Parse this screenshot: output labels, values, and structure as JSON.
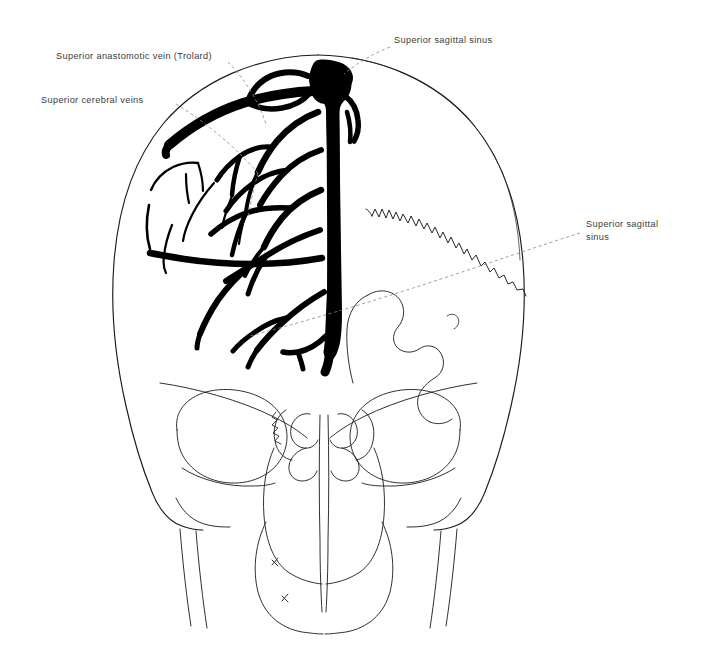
{
  "figure": {
    "background_color": "#ffffff",
    "ink_color": "#000000",
    "outline_color": "#1a1a1a",
    "label_color": "#3b3b3b",
    "leader_color": "#8a8a8a"
  },
  "labels": [
    {
      "id": "superior-anastomotic-vein",
      "text": "Superior anastomotic vein (Trolard)",
      "x": 56,
      "y": 59,
      "anchor": "start"
    },
    {
      "id": "superior-cerebral-veins",
      "text": "Superior cerebral veins",
      "x": 41,
      "y": 103,
      "anchor": "start"
    },
    {
      "id": "superior-sagittal-sinus-top",
      "text": "Superior sagittal sinus",
      "x": 394,
      "y": 43,
      "anchor": "start"
    },
    {
      "id": "superior-sagittal-sinus-right-line1",
      "text": "Superior sagittal",
      "x": 586,
      "y": 227,
      "anchor": "start"
    },
    {
      "id": "superior-sagittal-sinus-right-line2",
      "text": "sinus",
      "x": 586,
      "y": 240,
      "anchor": "start"
    }
  ],
  "structures": [
    {
      "id": "cranial-vault",
      "name": "Cranial vault outline"
    },
    {
      "id": "superior-sagittal-sinus",
      "name": "Superior sagittal sinus"
    },
    {
      "id": "superior-anastomotic-vein",
      "name": "Superior anastomotic vein of Trolard"
    },
    {
      "id": "superior-cerebral-veins",
      "name": "Superior cerebral veins"
    },
    {
      "id": "coronal-suture",
      "name": "Zigzag cranial suture"
    },
    {
      "id": "left-orbit",
      "name": "Left orbital cavity"
    },
    {
      "id": "right-orbit",
      "name": "Right orbital cavity"
    },
    {
      "id": "nasal-cavity",
      "name": "Nasal cavity and turbinates"
    },
    {
      "id": "maxilla",
      "name": "Maxillary region"
    },
    {
      "id": "mandible-rami",
      "name": "Mandibular rami"
    }
  ]
}
